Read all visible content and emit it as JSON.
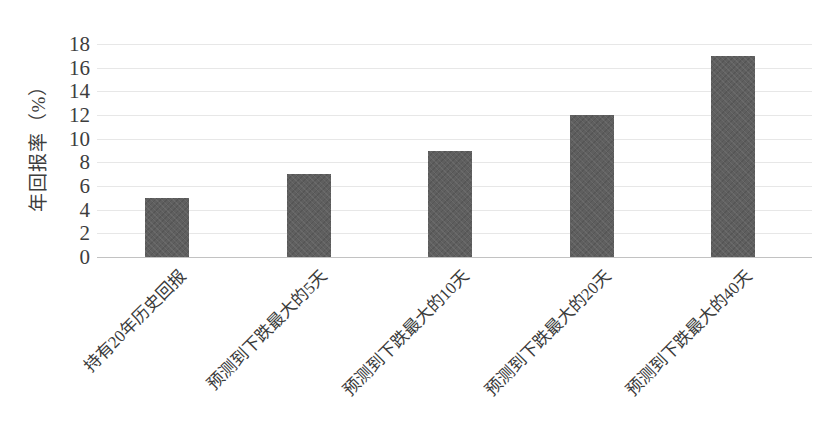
{
  "chart_data": {
    "type": "bar",
    "title": "",
    "xlabel": "",
    "ylabel": "年回报率（%）",
    "ylim": [
      0,
      18
    ],
    "ytick_step": 2,
    "yticks": [
      0,
      2,
      4,
      6,
      8,
      10,
      12,
      14,
      16,
      18
    ],
    "categories": [
      "持有20年历史回报",
      "预测到下跌最大的5天",
      "预测到下跌最大的10天",
      "预测到下跌最大的20天",
      "预测到下跌最大的40天"
    ],
    "values": [
      5,
      7,
      9,
      12,
      17
    ],
    "series_name": "",
    "legend": "none",
    "grid": "horizontal",
    "x_label_rotation_deg": -45,
    "bar_color": "#5f5f5f",
    "gridline_color": "#e4e4e4",
    "axis_line_color": "#c2c2c2",
    "text_color": "#3a3a3a",
    "background_color": "#ffffff"
  }
}
